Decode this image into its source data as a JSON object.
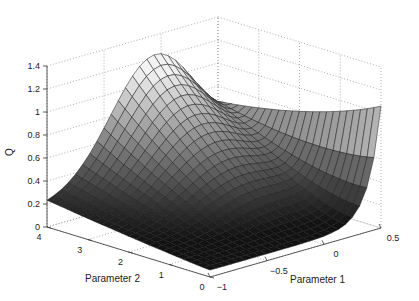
{
  "chart_data": {
    "type": "surface",
    "title": "",
    "xlabel": "Parameter 1",
    "ylabel": "Parameter 2",
    "zlabel": "Q",
    "xlim": [
      -1,
      0.5
    ],
    "ylim": [
      0,
      4
    ],
    "zlim": [
      0,
      1.4
    ],
    "xticks": [
      -1,
      -0.5,
      0,
      0.5
    ],
    "xtick_labels": [
      "−1",
      "−0.5",
      "0",
      "0.5"
    ],
    "yticks": [
      0,
      1,
      2,
      3,
      4
    ],
    "ytick_labels": [
      "0",
      "1",
      "2",
      "3",
      "4"
    ],
    "zticks": [
      0,
      0.2,
      0.4,
      0.6,
      0.8,
      1,
      1.2,
      1.4
    ],
    "ztick_labels": [
      "0",
      "0.2",
      "0.4",
      "0.6",
      "0.8",
      "1",
      "1.2",
      "1.4"
    ],
    "grid": true,
    "colormap": "gray",
    "surface_description": "Bowl-shaped surface: low values (~0.05-0.2) along a valley near Parameter 1 between -1 and 0; rises to ~1.0 at Parameter 1 = 0.5, Parameter 2 = 0; broad ridge reaching ~1.1 toward high Parameter 2 (~4) near Parameter 1 ~ 0",
    "sample_points": [
      {
        "p1": -1,
        "p2": 4,
        "q": 0.2
      },
      {
        "p1": -1,
        "p2": 0,
        "q": 0.1
      },
      {
        "p1": 0,
        "p2": 4,
        "q": 1.1
      },
      {
        "p1": 0.5,
        "p2": 0,
        "q": 1.0
      },
      {
        "p1": -0.3,
        "p2": 0.5,
        "q": 0.05
      }
    ]
  },
  "labels": {
    "z": "Q",
    "x": "Parameter 1",
    "y": "Parameter 2"
  }
}
